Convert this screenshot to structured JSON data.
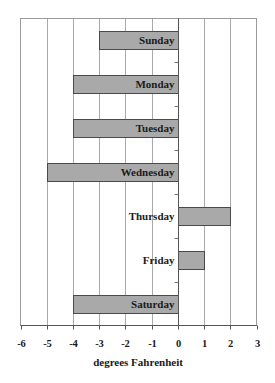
{
  "chart_data": {
    "type": "bar",
    "orientation": "horizontal",
    "title": "",
    "xlabel": "degrees Fahrenheit",
    "ylabel": "",
    "categories": [
      "Sunday",
      "Monday",
      "Tuesday",
      "Wednesday",
      "Thursday",
      "Friday",
      "Saturday"
    ],
    "values": [
      -3,
      -4,
      -4,
      -5,
      2,
      1,
      -4
    ],
    "xlim": [
      -6,
      3
    ],
    "xticks": [
      -6,
      -5,
      -4,
      -3,
      -2,
      -1,
      0,
      1,
      2,
      3
    ],
    "grid": {
      "vertical": true,
      "horizontal": false
    },
    "legend": null,
    "data_labels": "category names drawn at the zero end of each bar",
    "colors": {
      "bar_fill": "#a9a9a9",
      "bar_stroke": "#4a4a4a",
      "grid": "#a9a9a9"
    }
  }
}
